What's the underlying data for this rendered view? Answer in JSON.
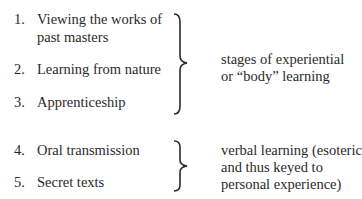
{
  "groups": [
    {
      "items": [
        {
          "number": "1.",
          "lines": [
            "Viewing the works of",
            "past masters"
          ]
        },
        {
          "number": "2.",
          "lines": [
            "Learning from nature"
          ]
        },
        {
          "number": "3.",
          "lines": [
            "Apprenticeship"
          ]
        }
      ],
      "annotation": [
        "stages of experiential",
        "or “body” learning"
      ]
    },
    {
      "items": [
        {
          "number": "4.",
          "lines": [
            "Oral transmission"
          ]
        },
        {
          "number": "5.",
          "lines": [
            "Secret texts"
          ]
        }
      ],
      "annotation": [
        "verbal learning (esoteric",
        "and thus keyed to",
        "personal experience)"
      ]
    }
  ]
}
